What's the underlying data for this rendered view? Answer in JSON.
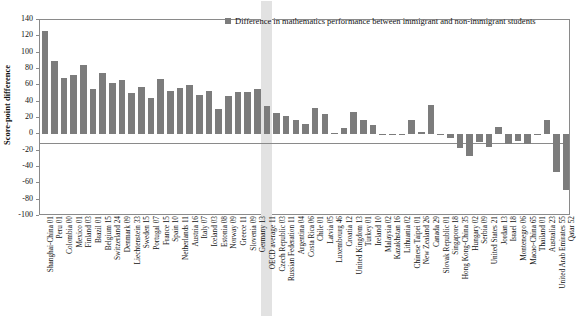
{
  "chart_data": {
    "type": "bar",
    "title": "",
    "legend": [
      "Difference in mathematics performance between immigrant and non-immigrant students"
    ],
    "legend_position": "top-center",
    "xlabel": "",
    "ylabel": "Score-point difference",
    "ylim": [
      -100,
      140
    ],
    "yticks": [
      140,
      120,
      100,
      80,
      60,
      40,
      20,
      0,
      -20,
      -40,
      -60,
      -80,
      -100
    ],
    "ytick_labels": [
      "140",
      "120",
      "100",
      "80",
      "60",
      "40",
      "20",
      "0",
      "-20",
      "-40",
      "-60",
      "-80",
      "-100"
    ],
    "grid": false,
    "bar_color": "#7c7c7c",
    "highlight_color": "#e2e2e2",
    "highlight_category": "OECD average 11",
    "categories": [
      "Shanghai-China 01",
      "Peru 01",
      "Colombia 00",
      "Mexico 01",
      "Finland 03",
      "Brazil 01",
      "Belgium 15",
      "Switzerland 24",
      "Denmark 09",
      "Liechtenstein 33",
      "Sweden 15",
      "Portugal 07",
      "France 15",
      "Spain 10",
      "Netherlands 11",
      "Austria 16",
      "Italy 07",
      "Iceland 03",
      "Estonia 08",
      "Norway 09",
      "Greece 11",
      "Slovenia 09",
      "Germany 13",
      "OECD average 11",
      "Czech Republic 03",
      "Russian Federation 11",
      "Argentina 04",
      "Costa Rica 06",
      "Chile 01",
      "Latvia 05",
      "Luxembourg 46",
      "Croatia 12",
      "United Kingdom 13",
      "Turkey 01",
      "Ireland 10",
      "Malaysia 02",
      "Kazakhstan 16",
      "Lithuania 02",
      "Chinese Taipei 01",
      "New Zealand 26",
      "Canada 29",
      "Slovak Republic 01",
      "Singapore 18",
      "Hong Kong-China 35",
      "Hungary 02",
      "Serbia 09",
      "United States 21",
      "Jordan 13",
      "Israel 18",
      "Montenegro 06",
      "Macao-China 65",
      "Thailand 01",
      "Australia 23",
      "United Arab Emirates 55",
      "Qatar 52"
    ],
    "values": [
      126,
      90,
      69,
      73,
      85,
      56,
      75,
      63,
      66,
      51,
      58,
      45,
      68,
      53,
      57,
      60,
      48,
      53,
      31,
      47,
      52,
      52,
      55,
      35,
      26,
      23,
      18,
      13,
      32,
      25,
      2,
      8,
      27,
      17,
      11,
      1,
      -1,
      1,
      18,
      3,
      36,
      -1,
      -4,
      -17,
      -26,
      -9,
      -16,
      9,
      -12,
      -8,
      -12,
      -1,
      18,
      -46,
      -68
    ],
    "ylabel_text": "Score-point difference"
  }
}
